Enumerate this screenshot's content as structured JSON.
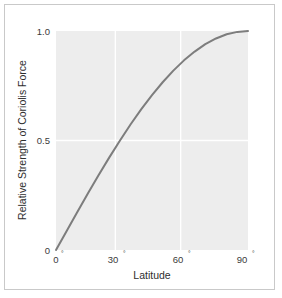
{
  "chart_data": {
    "type": "line",
    "title": "",
    "subtitle": "",
    "xlabel": "Latitude",
    "ylabel": "Relative Strength of Coriolis Force",
    "xlim": [
      0,
      90
    ],
    "ylim": [
      0,
      1.0
    ],
    "x_tick_labels": [
      "0°",
      "30°",
      "60°",
      "90°"
    ],
    "x_tick_values": [
      0,
      30,
      60,
      90
    ],
    "x_tick_numbers": [
      "0",
      "30",
      "60",
      "90"
    ],
    "x_tick_degree_symbol": "°",
    "y_tick_labels": [
      "0",
      "0.5",
      "1.0"
    ],
    "y_tick_values": [
      0,
      0.5,
      1.0
    ],
    "grid": true,
    "grid_color": "#ffffff",
    "grid_x_values": [
      30,
      60
    ],
    "grid_y_values": [
      0.5
    ],
    "legend": false,
    "legend_position": "none",
    "annotations": [],
    "plot_background_color": "#ededed",
    "figure_background_color": "#ffffff",
    "frame_color": "#c9c9c9",
    "series": [
      {
        "name": "Relative strength of Coriolis force",
        "function": "sin(latitude)",
        "color": "#7d7d7d",
        "line_width": 2,
        "x": [
          0,
          5,
          10,
          15,
          20,
          25,
          30,
          35,
          40,
          45,
          50,
          55,
          60,
          65,
          70,
          75,
          80,
          85,
          90
        ],
        "values": [
          0.0,
          0.087,
          0.174,
          0.259,
          0.342,
          0.423,
          0.5,
          0.574,
          0.643,
          0.707,
          0.766,
          0.819,
          0.866,
          0.906,
          0.94,
          0.966,
          0.985,
          0.996,
          1.0
        ]
      }
    ]
  }
}
